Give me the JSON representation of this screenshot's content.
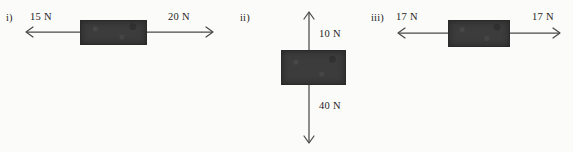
{
  "figure": {
    "background_color": "#fbfbfa",
    "block_color": "#3c3c3c",
    "arrow_color": "#4a4a4a",
    "width": 573,
    "height": 152
  },
  "diagrams": [
    {
      "id": "i",
      "label": "i)",
      "orientation": "horizontal",
      "block": {
        "x": 80,
        "y": 20,
        "width": 65,
        "height": 23
      },
      "forces": [
        {
          "name": "left-force",
          "value": "15 N",
          "magnitude": 15,
          "unit": "N",
          "direction": "left",
          "label_x": 30,
          "label_y": 11
        },
        {
          "name": "right-force",
          "value": "20 N",
          "magnitude": 20,
          "unit": "N",
          "direction": "right",
          "label_x": 168,
          "label_y": 11
        }
      ],
      "axis": {
        "y": 32,
        "x_start": 26,
        "x_end": 213
      },
      "label_pos": {
        "x": 6,
        "y": 12
      }
    },
    {
      "id": "ii",
      "label": "ii)",
      "orientation": "vertical",
      "block": {
        "x": 281,
        "y": 50,
        "width": 63,
        "height": 33
      },
      "forces": [
        {
          "name": "up-force",
          "value": "10 N",
          "magnitude": 10,
          "unit": "N",
          "direction": "up",
          "label_x": 319,
          "label_y": 28
        },
        {
          "name": "down-force",
          "value": "40 N",
          "magnitude": 40,
          "unit": "N",
          "direction": "down",
          "label_x": 319,
          "label_y": 100
        }
      ],
      "axis": {
        "x": 309,
        "y_start": 12,
        "y_end": 143
      },
      "label_pos": {
        "x": 240,
        "y": 12
      }
    },
    {
      "id": "iii",
      "label": "iii)",
      "orientation": "horizontal",
      "block": {
        "x": 448,
        "y": 20,
        "width": 60,
        "height": 25
      },
      "forces": [
        {
          "name": "left-force",
          "value": "17 N",
          "magnitude": 17,
          "unit": "N",
          "direction": "left",
          "label_x": 396,
          "label_y": 11
        },
        {
          "name": "right-force",
          "value": "17 N",
          "magnitude": 17,
          "unit": "N",
          "direction": "right",
          "label_x": 532,
          "label_y": 11
        }
      ],
      "axis": {
        "y": 33,
        "x_start": 398,
        "x_end": 560
      },
      "label_pos": {
        "x": 371,
        "y": 12
      }
    }
  ]
}
